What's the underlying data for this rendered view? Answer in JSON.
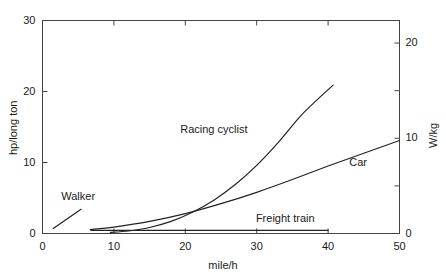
{
  "chart_data": {
    "type": "line",
    "title": "",
    "subtitle": "",
    "xlabel": "mile/h",
    "ylabel": "hp/long ton",
    "ylabel_right": "W/kg",
    "xlim": [
      0,
      50
    ],
    "ylim": [
      0,
      30
    ],
    "ylim_right": [
      0,
      22.37
    ],
    "grid": false,
    "legend": "inline-labels",
    "xticks": [
      0,
      10,
      20,
      30,
      40,
      50
    ],
    "xtick_labels": [
      "0",
      "10",
      "20",
      "30",
      "40",
      "50"
    ],
    "yticks": [
      0,
      10,
      20,
      30
    ],
    "ytick_labels": [
      "0",
      "10",
      "20",
      "30"
    ],
    "yticks_right": [
      0,
      10,
      20
    ],
    "ytick_labels_right": [
      "0",
      "10",
      "20"
    ],
    "yticks_right_minor": [
      5,
      15
    ],
    "series": [
      {
        "name": "Walker",
        "label": "Walker",
        "label_x": 5.0,
        "label_y": 5.2,
        "x": [
          1.5,
          5.4
        ],
        "values": [
          0.7,
          3.4
        ]
      },
      {
        "name": "Racing cyclist",
        "label": "Racing cyclist",
        "label_x": 24.0,
        "label_y": 14.6,
        "x": [
          9.5,
          12,
          15,
          18,
          21,
          24,
          27,
          30,
          33,
          36,
          38,
          40.7
        ],
        "values": [
          0.15,
          0.35,
          0.85,
          1.7,
          3.0,
          4.7,
          6.9,
          9.6,
          12.8,
          16.4,
          18.4,
          20.9
        ]
      },
      {
        "name": "Car",
        "label": "Car",
        "label_x": 44.2,
        "label_y": 9.9,
        "x": [
          6.7,
          10,
          15,
          20,
          25,
          30,
          35,
          40,
          45,
          50
        ],
        "values": [
          0.55,
          0.9,
          1.7,
          2.8,
          4.2,
          5.8,
          7.6,
          9.5,
          11.3,
          13.1
        ]
      },
      {
        "name": "Freight train",
        "label": "Freight train",
        "label_x": 34.0,
        "label_y": 2.1,
        "x": [
          6.8,
          40.0
        ],
        "values": [
          0.45,
          0.45
        ]
      }
    ]
  },
  "axes": {
    "x_title": "mile/h",
    "y_left_title": "hp/long ton",
    "y_right_title": "W/kg"
  },
  "colors": {
    "line": "#222222",
    "axis": "#444444",
    "background": "#ffffff"
  }
}
